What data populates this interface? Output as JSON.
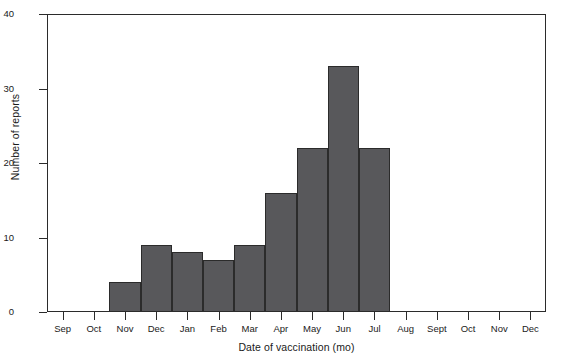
{
  "chart_data": {
    "type": "bar",
    "title": "",
    "subtitle": "",
    "xlabel": "Date of vaccination (mo)",
    "ylabel": "Number of reports",
    "categories": [
      "Sep",
      "Oct",
      "Nov",
      "Dec",
      "Jan",
      "Feb",
      "Mar",
      "Apr",
      "May",
      "Jun",
      "Jul",
      "Aug",
      "Sept",
      "Oct",
      "Nov",
      "Dec"
    ],
    "values": [
      0,
      0,
      4,
      9,
      8,
      7,
      9,
      16,
      22,
      33,
      22,
      0,
      0,
      0,
      0,
      0
    ],
    "series": [
      {
        "name": "Number of reports",
        "values": [
          0,
          0,
          4,
          9,
          8,
          7,
          9,
          16,
          22,
          33,
          22,
          0,
          0,
          0,
          0,
          0
        ]
      }
    ],
    "ylim": [
      0,
      40
    ],
    "yticks": [
      0,
      10,
      20,
      30,
      40
    ],
    "ytick_labels": [
      "0",
      "10",
      "20",
      "30",
      "40"
    ],
    "xtick_labels": [
      "Sep",
      "Oct",
      "Nov",
      "Dec",
      "Jan",
      "Feb",
      "Mar",
      "Apr",
      "May",
      "Jun",
      "Jul",
      "Aug",
      "Sept",
      "Oct",
      "Nov",
      "Dec"
    ],
    "grid": false,
    "legend": false,
    "legend_position": "none",
    "style": "histogram-step",
    "colors": {
      "bar_fill": "#58585b",
      "bar_edge": "#2b2b2b",
      "axis": "#2b2b2b",
      "text": "#1a1a1a",
      "background": "#ffffff"
    }
  }
}
